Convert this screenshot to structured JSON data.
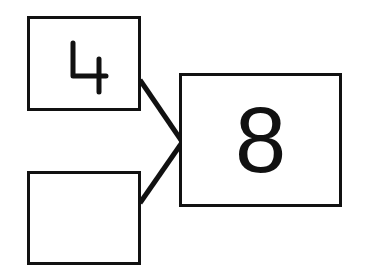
{
  "diagram": {
    "type": "number-bond",
    "whole": {
      "value": "8"
    },
    "parts": [
      {
        "position": "top",
        "value": "4"
      },
      {
        "position": "bottom",
        "value": ""
      }
    ],
    "colors": {
      "stroke": "#111111",
      "background": "#ffffff"
    }
  }
}
